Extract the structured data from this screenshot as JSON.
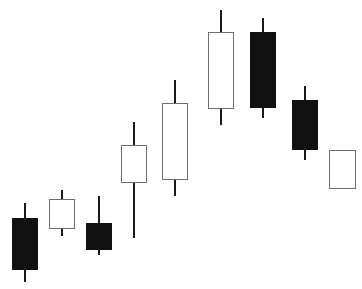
{
  "chart_data": {
    "type": "candlestick",
    "title": "",
    "xlabel": "",
    "ylabel": "",
    "axes_visible": false,
    "grid": false,
    "legend": null,
    "price_scale_note": "relative units derived from pixel height (price = 289 - y)",
    "ylim": [
      0,
      289
    ],
    "colors": {
      "bullish_fill": "#ffffff",
      "bullish_border": "#6e6e6e",
      "bearish_fill": "#111111",
      "wick": "#1a1a1a",
      "background": "#ffffff"
    },
    "categories": [
      "1",
      "2",
      "3",
      "4",
      "5",
      "6",
      "7",
      "8",
      "9"
    ],
    "candles": [
      {
        "x_left": 12,
        "width": 26,
        "open": 71,
        "high": 86,
        "low": 7,
        "close": 19,
        "direction": "bearish"
      },
      {
        "x_left": 49,
        "width": 26,
        "open": 60,
        "high": 99,
        "low": 53,
        "close": 90,
        "direction": "bullish"
      },
      {
        "x_left": 86,
        "width": 26,
        "open": 66,
        "high": 93,
        "low": 34,
        "close": 39,
        "direction": "bearish"
      },
      {
        "x_left": 121,
        "width": 26,
        "open": 106,
        "high": 167,
        "low": 51,
        "close": 144,
        "direction": "bullish"
      },
      {
        "x_left": 162,
        "width": 26,
        "open": 109,
        "high": 209,
        "low": 93,
        "close": 186,
        "direction": "bullish"
      },
      {
        "x_left": 208,
        "width": 26,
        "open": 180,
        "high": 279,
        "low": 164,
        "close": 257,
        "direction": "bullish"
      },
      {
        "x_left": 250,
        "width": 26,
        "open": 257,
        "high": 271,
        "low": 171,
        "close": 181,
        "direction": "bearish"
      },
      {
        "x_left": 292,
        "width": 26,
        "open": 189,
        "high": 203,
        "low": 129,
        "close": 139,
        "direction": "bearish"
      },
      {
        "x_left": 329,
        "width": 27,
        "open": 100,
        "high": 139,
        "low": 100,
        "close": 139,
        "direction": "bullish"
      }
    ]
  }
}
